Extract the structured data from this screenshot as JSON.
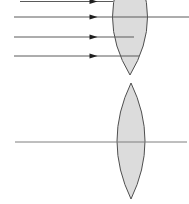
{
  "canvas": {
    "width": 189,
    "height": 204,
    "background": "#ffffff"
  },
  "colors": {
    "lens_fill": "#dcdcdc",
    "lens_stroke": "#4f4f4f",
    "ray_line": "#5a5a5a",
    "arrowhead": "#1f1f1f",
    "axis_line": "#7f7f7f"
  },
  "figures": [
    {
      "name": "top-converging-lens-figure",
      "lens": {
        "name": "converging-lens-top",
        "cx": 130,
        "tip_top_y": -41,
        "tip_bottom_y": 75,
        "mid_y": 17,
        "half_width": 17.5
      },
      "rays": [
        {
          "name": "parallel-ray-1",
          "y": 1.5,
          "x1": 20,
          "x2": 113,
          "arrow_x": 96
        },
        {
          "name": "parallel-ray-2",
          "y": 17,
          "x1": 14,
          "x2": 189,
          "arrow_x": 96
        },
        {
          "name": "parallel-ray-3",
          "y": 37,
          "x1": 14,
          "x2": 134,
          "arrow_x": 96
        },
        {
          "name": "parallel-ray-4",
          "y": 56,
          "x1": 14,
          "x2": 139,
          "arrow_x": 96
        }
      ],
      "axis": null
    },
    {
      "name": "bottom-lens-on-axis-figure",
      "lens": {
        "name": "biconvex-lens-bottom",
        "cx": 131,
        "tip_top_y": 83,
        "tip_bottom_y": 199,
        "mid_y": 141,
        "half_width": 14
      },
      "rays": [],
      "axis": {
        "name": "optical-axis",
        "y": 142,
        "x1": 15,
        "x2": 187
      }
    }
  ],
  "arrow_style": {
    "length": 6.5,
    "half_height": 2.6
  }
}
